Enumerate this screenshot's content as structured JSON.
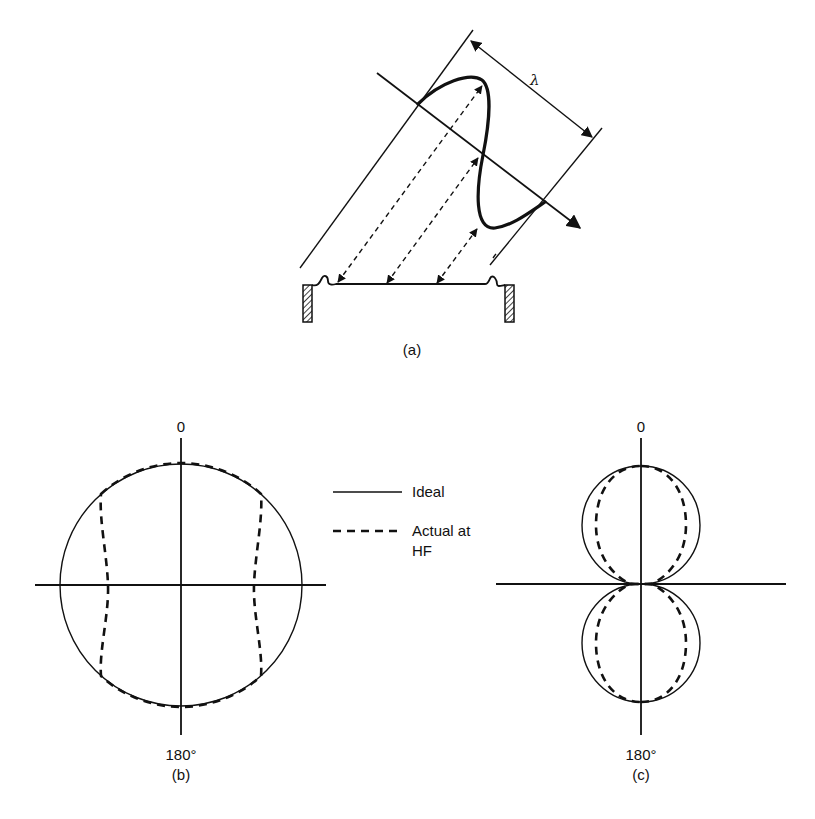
{
  "figure_a": {
    "label": "(a)",
    "wavelength_symbol": "λ"
  },
  "figure_b": {
    "label": "(b)",
    "top_angle": "0",
    "bottom_angle": "180°"
  },
  "figure_c": {
    "label": "(c)",
    "top_angle": "0",
    "bottom_angle": "180°"
  },
  "legend": {
    "ideal_label": "Ideal",
    "actual_label_line1": "Actual at",
    "actual_label_line2": "HF"
  },
  "colors": {
    "ink": "#111111",
    "background": "#ffffff"
  }
}
